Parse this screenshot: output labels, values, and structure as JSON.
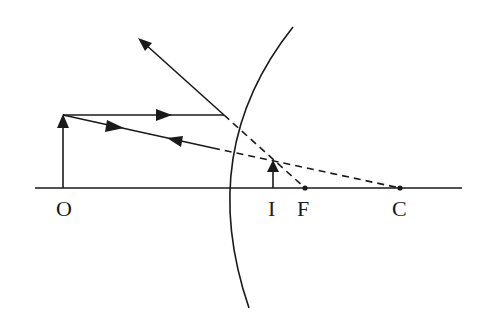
{
  "diagram": {
    "type": "convex-mirror-ray-diagram",
    "labels": {
      "object": "O",
      "image": "I",
      "focus": "F",
      "center": "C"
    },
    "colors": {
      "ink": "#1a1a1a",
      "background": "#ffffff"
    },
    "elements": [
      "principal axis",
      "convex mirror arc",
      "object arrow at O",
      "virtual image arrow at I",
      "parallel ray reflecting away as if from F",
      "ray toward C reflecting back on itself",
      "dashed extensions behind mirror to F and C"
    ]
  }
}
